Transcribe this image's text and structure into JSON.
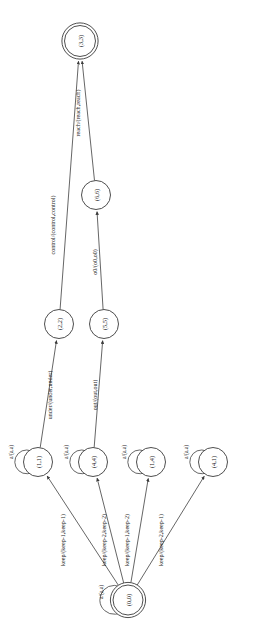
{
  "diagram": {
    "type": "finite-state-transducer",
    "orientation": "rotated-90",
    "background": "#ffffff",
    "stroke_color": "#3a3a3a",
    "nodes": [
      {
        "id": "n33",
        "label": "(3,3)",
        "cx": 80,
        "cy": 41,
        "r": 15.5,
        "double": true
      },
      {
        "id": "n66",
        "label": "(6,6)",
        "cx": 96,
        "cy": 195,
        "r": 14.5,
        "double": false
      },
      {
        "id": "n22",
        "label": "(2,2)",
        "cx": 59,
        "cy": 324,
        "r": 14.5,
        "double": false
      },
      {
        "id": "n55",
        "label": "(5,5)",
        "cx": 104,
        "cy": 324,
        "r": 14.5,
        "double": false
      },
      {
        "id": "n11",
        "label": "(1,1)",
        "cx": 38,
        "cy": 462,
        "r": 14.5,
        "double": false
      },
      {
        "id": "n44",
        "label": "(4,4)",
        "cx": 93,
        "cy": 462,
        "r": 14.5,
        "double": false
      },
      {
        "id": "n14",
        "label": "(1,4)",
        "cx": 151,
        "cy": 462,
        "r": 14.5,
        "double": false
      },
      {
        "id": "n41",
        "label": "(4,1)",
        "cx": 213,
        "cy": 462,
        "r": 14.5,
        "double": false
      },
      {
        "id": "n00",
        "label": "(0,0)",
        "cx": 128,
        "cy": 600,
        "r": 15.0,
        "double": true
      }
    ],
    "self_loops": [
      {
        "node": "n11",
        "label": "a/(a,a)",
        "lx": 11,
        "ly": 452
      },
      {
        "node": "n44",
        "label": "a/(a,a)",
        "lx": 66,
        "ly": 452
      },
      {
        "node": "n14",
        "label": "a/(a,a)",
        "lx": 124,
        "ly": 452
      },
      {
        "node": "n41",
        "label": "a/(a,a)",
        "lx": 186,
        "ly": 452
      },
      {
        "node": "n00",
        "label": "a/(a,a)",
        "lx": 101,
        "ly": 592
      }
    ],
    "edges": [
      {
        "id": "e1",
        "from": "n22",
        "to": "n33",
        "label": "control/(control,control)",
        "lx": 53,
        "ly": 225
      },
      {
        "id": "e2",
        "from": "n66",
        "to": "n33",
        "label": "reach/(reach,reach)",
        "lx": 78,
        "ly": 113
      },
      {
        "id": "e3",
        "from": "n55",
        "to": "n66",
        "label": "o0/(o0,o0)",
        "lx": 95,
        "ly": 262
      },
      {
        "id": "e4",
        "from": "n11",
        "to": "n22",
        "label": "under/(under,under)",
        "lx": 50,
        "ly": 395
      },
      {
        "id": "e5",
        "from": "n44",
        "to": "n55",
        "label": "out/(out,out)",
        "lx": 95,
        "ly": 395
      },
      {
        "id": "e6",
        "from": "n00",
        "to": "n11",
        "label": "keep/(keep-1,keep-1)",
        "lx": 63,
        "ly": 540
      },
      {
        "id": "e7",
        "from": "n00",
        "to": "n44",
        "label": "keep/(keep-2,keep-2)",
        "lx": 104,
        "ly": 540
      },
      {
        "id": "e8",
        "from": "n00",
        "to": "n14",
        "label": "keep/(keep-1,keep-2)",
        "lx": 127,
        "ly": 540
      },
      {
        "id": "e9",
        "from": "n00",
        "to": "n41",
        "label": "keep/(keep-2,keep-1)",
        "lx": 161,
        "ly": 540
      }
    ]
  }
}
